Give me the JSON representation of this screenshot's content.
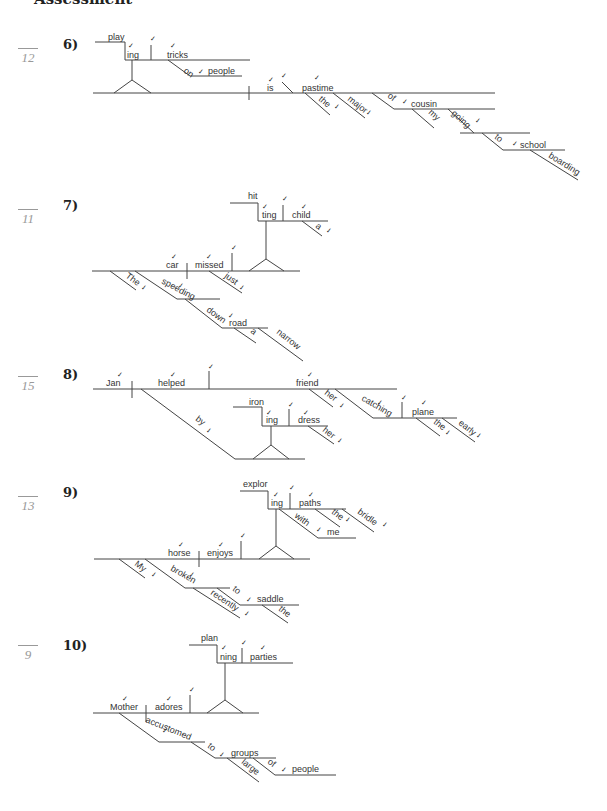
{
  "header": {
    "title": "Assessment"
  },
  "exercises": [
    {
      "number": "6)",
      "score": "12",
      "words": {
        "play": "play",
        "ing": "ing",
        "tricks": "tricks",
        "on": "on",
        "people": "people",
        "is": "is",
        "pastime": "pastime",
        "the": "the",
        "major": "major",
        "of": "of",
        "cousin": "cousin",
        "my": "my",
        "going": "going",
        "to": "to",
        "school": "school",
        "boarding": "boarding"
      }
    },
    {
      "number": "7)",
      "score": "11",
      "words": {
        "hit": "hit",
        "ting": "ting",
        "child": "child",
        "a": "a",
        "car": "car",
        "missed": "missed",
        "just": "just",
        "The": "The",
        "speeding": "speeding",
        "down": "down",
        "road": "road",
        "a2": "a",
        "narrow": "narrow"
      }
    },
    {
      "number": "8)",
      "score": "15",
      "words": {
        "Jan": "Jan",
        "helped": "helped",
        "friend": "friend",
        "her": "her",
        "catching": "catching",
        "plane": "plane",
        "the": "the",
        "early": "early",
        "iron": "iron",
        "ing": "ing",
        "dress": "dress",
        "her2": "her",
        "by": "by"
      }
    },
    {
      "number": "9)",
      "score": "13",
      "words": {
        "explor": "explor",
        "ing": "ing",
        "paths": "paths",
        "the": "the",
        "bridle": "bridle",
        "with": "with",
        "me": "me",
        "horse": "horse",
        "enjoys": "enjoys",
        "My": "My",
        "broken": "broken",
        "recently": "recently",
        "to": "to",
        "saddle": "saddle",
        "the2": "the"
      }
    },
    {
      "number": "10)",
      "score": "9",
      "words": {
        "plan": "plan",
        "ning": "ning",
        "parties": "parties",
        "Mother": "Mother",
        "adores": "adores",
        "accustomed": "accustomed",
        "to": "to",
        "groups": "groups",
        "large": "large",
        "of": "of",
        "people": "people"
      }
    }
  ],
  "icons": {
    "check": "✓"
  },
  "colors": {
    "line": "#444444",
    "text": "#333333",
    "score": "#999999"
  }
}
